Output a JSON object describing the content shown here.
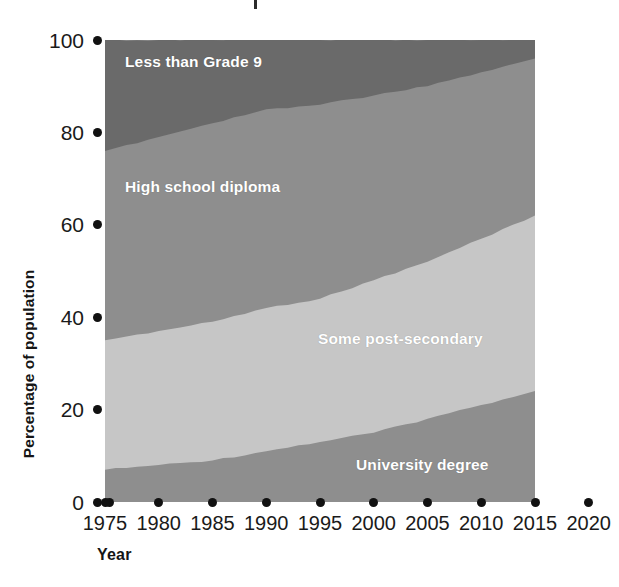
{
  "chart_data": {
    "type": "area",
    "title": "",
    "xlabel": "Year",
    "ylabel": "Percentage of population",
    "xlim": [
      1975,
      2020
    ],
    "ylim": [
      0,
      100
    ],
    "grid": false,
    "legend_position": "inline-labels",
    "stacked": true,
    "x": [
      1975,
      1980,
      1985,
      1990,
      1995,
      2000,
      2005,
      2010,
      2015
    ],
    "x_tick_labels": [
      "1975",
      "1980",
      "1985",
      "1990",
      "1995",
      "2000",
      "2005",
      "2010",
      "2015",
      "2020"
    ],
    "y_tick_labels": [
      "100",
      "80",
      "60",
      "40",
      "20",
      "0"
    ],
    "y_ticks": [
      100,
      80,
      60,
      40,
      20,
      0
    ],
    "series": [
      {
        "name": "University degree",
        "color": "#8e8e8e",
        "label_color": "#ffffff",
        "values": [
          7,
          8,
          9,
          11,
          13,
          15,
          18,
          21,
          24
        ],
        "cumulative_top": [
          7,
          8,
          9,
          11,
          13,
          15,
          18,
          21,
          24
        ]
      },
      {
        "name": "Some post-secondary",
        "color": "#c6c6c6",
        "label_color": "#ffffff",
        "values": [
          28,
          29,
          30,
          31,
          31,
          33,
          34,
          36,
          38
        ],
        "cumulative_top": [
          35,
          37,
          39,
          42,
          44,
          48,
          52,
          57,
          62
        ]
      },
      {
        "name": "High school diploma",
        "color": "#8e8e8e",
        "label_color": "#ffffff",
        "values": [
          41,
          42,
          43,
          43,
          42,
          40,
          38,
          36,
          34
        ],
        "cumulative_top": [
          76,
          79,
          82,
          85,
          86,
          88,
          90,
          93,
          96
        ]
      },
      {
        "name": "Less than Grade 9",
        "color": "#6a6a6a",
        "label_color": "#ffffff",
        "values": [
          24,
          21,
          18,
          15,
          14,
          12,
          10,
          7,
          4
        ],
        "cumulative_top": [
          100,
          100,
          100,
          100,
          100,
          100,
          100,
          100,
          100
        ]
      }
    ]
  },
  "axes": {
    "y_title": "Percentage of population",
    "x_title": "Year",
    "y_ticks": [
      {
        "label": "100",
        "value": 100
      },
      {
        "label": "80",
        "value": 80
      },
      {
        "label": "60",
        "value": 60
      },
      {
        "label": "40",
        "value": 40
      },
      {
        "label": "20",
        "value": 20
      },
      {
        "label": "0",
        "value": 0
      }
    ],
    "x_ticks": [
      {
        "label": "1975",
        "value": 1975
      },
      {
        "label": "1980",
        "value": 1980
      },
      {
        "label": "1985",
        "value": 1985
      },
      {
        "label": "1990",
        "value": 1990
      },
      {
        "label": "1995",
        "value": 1995
      },
      {
        "label": "2000",
        "value": 2000
      },
      {
        "label": "2005",
        "value": 2005
      },
      {
        "label": "2010",
        "value": 2010
      },
      {
        "label": "2015",
        "value": 2015
      },
      {
        "label": "2020",
        "value": 2020
      }
    ]
  },
  "labels": {
    "grade9": "Less than Grade 9",
    "high_school": "High school diploma",
    "post_secondary": "Some post-secondary",
    "university": "University degree"
  },
  "colors": {
    "band_top": "#6a6a6a",
    "band_high_school": "#8e8e8e",
    "band_post_secondary": "#c6c6c6",
    "band_university": "#8e8e8e",
    "tick": "#111111",
    "text": "#1a1a1a",
    "background": "#ffffff"
  }
}
